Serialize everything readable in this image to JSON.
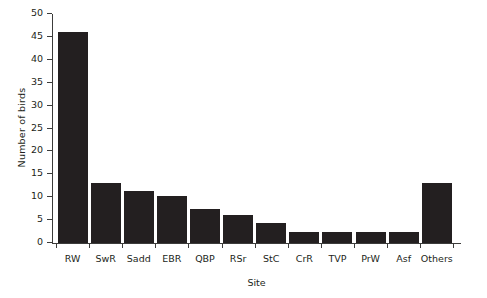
{
  "chart_data": {
    "type": "bar",
    "title": "",
    "xlabel": "Site",
    "ylabel": "Number of birds",
    "categories": [
      "RW",
      "SwR",
      "Sadd",
      "EBR",
      "QBP",
      "RSr",
      "StC",
      "CrR",
      "TVP",
      "PrW",
      "Asf",
      "Others"
    ],
    "values": [
      46,
      13,
      11.3,
      10.3,
      7.4,
      6.2,
      4.4,
      2.4,
      2.4,
      2.4,
      2.4,
      13.1
    ],
    "ylim": [
      0,
      50
    ],
    "yticks": [
      0,
      5,
      10,
      15,
      20,
      25,
      30,
      35,
      40,
      45,
      50
    ],
    "ytick_labels": [
      "0",
      "5",
      "10",
      "15",
      "20",
      "25",
      "30",
      "35",
      "40",
      "45",
      "50"
    ],
    "grid": false,
    "legend": "none",
    "bar_color": "#231f20",
    "axis_color": "#3c3c3b",
    "background_color": "#ffffff"
  }
}
